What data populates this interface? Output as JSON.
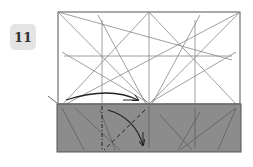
{
  "step": {
    "number": "11"
  },
  "diagram": {
    "type": "origami-fold-step",
    "paper_color": "#ffffff",
    "folded_band_color": "#8c8c8c",
    "line_color": "#777777",
    "arrow_color": "#222222"
  }
}
